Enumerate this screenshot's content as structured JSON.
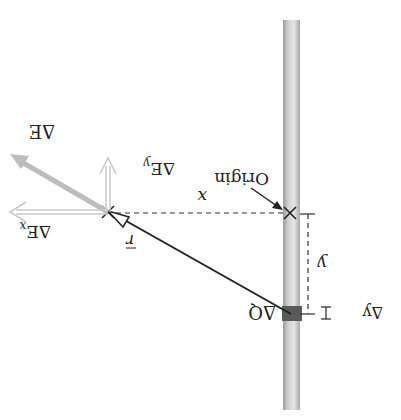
{
  "diagram": {
    "orientation": "rotated 180 degrees",
    "labels": {
      "origin": "Origin",
      "x": "x",
      "y": "y",
      "delta_q": "ΔQ",
      "delta_y": "Δy",
      "r_vec": "r",
      "delta_e": "ΔE",
      "delta_ex": "ΔE",
      "delta_ex_sub": "x",
      "delta_ey": "ΔE",
      "delta_ey_sub": "y"
    },
    "colors": {
      "rod": "#d4d4d4",
      "rod_edge": "#b0b0b0",
      "charge_element": "#5a5a5a",
      "field_vector": "#b8b8b8",
      "component_vectors": "#c8c8c8",
      "line": "#222222"
    }
  }
}
